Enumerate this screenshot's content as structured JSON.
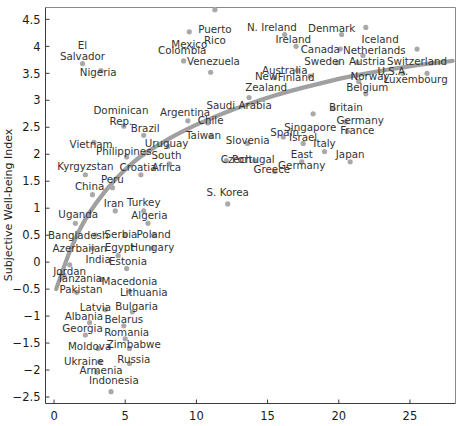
{
  "chart_data": {
    "type": "scatter",
    "title": "",
    "xlabel": "",
    "ylabel": "Subjective Well-being Index",
    "xlim": [
      -0.6,
      28.2
    ],
    "ylim": [
      -2.62,
      4.72
    ],
    "xticks": [
      0,
      5,
      10,
      15,
      20,
      25
    ],
    "xtick_labels": [
      "0",
      "5",
      "10",
      "15",
      "20",
      "25"
    ],
    "yticks": [
      4.5,
      4,
      3.5,
      3,
      2.5,
      2,
      1.5,
      1,
      0.5,
      0,
      -0.5,
      -1,
      -1.5,
      -2,
      -2.5
    ],
    "ytick_labels": [
      "4.5",
      "4",
      "3.5",
      "3",
      "2.5",
      "2",
      "1.5",
      "1",
      "0.5",
      "0",
      "−0.5",
      "−1",
      "−1.5",
      "−2",
      "−2.5"
    ],
    "grid": false,
    "legend": null,
    "marker_color": "#a9a9a9",
    "trend_color": "#a0a0a0",
    "points": [
      {
        "label": "Puerto Rico",
        "x": 11.3,
        "y": 4.68,
        "lx": 11.3,
        "ly": 4.32,
        "lines": [
          "Puerto",
          "Rico"
        ]
      },
      {
        "label": "Mexico",
        "x": 9.5,
        "y": 4.27,
        "lx": 9.5,
        "ly": 4.03,
        "lines": [
          "Mexico"
        ]
      },
      {
        "label": "N. Ireland",
        "x": 16.2,
        "y": 4.22,
        "lx": 15.3,
        "ly": 4.36,
        "lines": [
          "N. Ireland"
        ]
      },
      {
        "label": "Denmark",
        "x": 20.2,
        "y": 4.22,
        "lx": 19.5,
        "ly": 4.34,
        "lines": [
          "Denmark"
        ]
      },
      {
        "label": "Iceland",
        "x": 21.9,
        "y": 4.35,
        "lx": 22.9,
        "ly": 4.12,
        "lines": [
          "Iceland"
        ]
      },
      {
        "label": "Ireland",
        "x": 17.0,
        "y": 4.0,
        "lx": 16.8,
        "ly": 4.13,
        "lines": [
          "Ireland"
        ]
      },
      {
        "label": "El Salvador",
        "x": 2.0,
        "y": 3.68,
        "lx": 2.0,
        "ly": 4.02,
        "lines": [
          "El",
          "Salvador"
        ]
      },
      {
        "label": "Colombia",
        "x": 9.1,
        "y": 3.73,
        "lx": 9.0,
        "ly": 3.92,
        "lines": [
          "Colombia"
        ]
      },
      {
        "label": "Canada",
        "x": 20.1,
        "y": 3.95,
        "lx": 18.7,
        "ly": 3.95,
        "lines": [
          "Canada"
        ]
      },
      {
        "label": "Netherlands",
        "x": 21.7,
        "y": 3.83,
        "lx": 22.5,
        "ly": 3.93,
        "lines": [
          "Netherlands"
        ]
      },
      {
        "label": "Switzerland",
        "x": 25.5,
        "y": 3.95,
        "lx": 25.5,
        "ly": 3.72,
        "lines": [
          "Switzerland"
        ]
      },
      {
        "label": "Venezuela",
        "x": 11.0,
        "y": 3.52,
        "lx": 11.2,
        "ly": 3.72,
        "lines": [
          "Venezuela"
        ]
      },
      {
        "label": "Sweden",
        "x": 19.9,
        "y": 3.7,
        "lx": 19.0,
        "ly": 3.73,
        "lines": [
          "Sweden"
        ]
      },
      {
        "label": "Austria",
        "x": 21.3,
        "y": 3.7,
        "lx": 22.0,
        "ly": 3.72,
        "lines": [
          "Austria"
        ]
      },
      {
        "label": "Nigeria",
        "x": 3.3,
        "y": 3.55,
        "lx": 3.1,
        "ly": 3.52,
        "lines": [
          "Nigeria"
        ]
      },
      {
        "label": "Australia",
        "x": 17.1,
        "y": 3.55,
        "lx": 16.2,
        "ly": 3.56,
        "lines": [
          "Australia"
        ]
      },
      {
        "label": "Finland",
        "x": 18.0,
        "y": 3.45,
        "lx": 17.0,
        "ly": 3.42,
        "lines": [
          "Finland"
        ]
      },
      {
        "label": "New Zealand",
        "x": 15.5,
        "y": 3.42,
        "lx": 14.9,
        "ly": 3.45,
        "lines": [
          "New",
          "Zealand"
        ]
      },
      {
        "label": "U.S.A.",
        "x": 24.5,
        "y": 3.5,
        "lx": 23.8,
        "ly": 3.53,
        "lines": [
          "U.S.A."
        ]
      },
      {
        "label": "Luxembourg",
        "x": 26.2,
        "y": 3.5,
        "lx": 25.4,
        "ly": 3.39,
        "lines": [
          "Luxembourg"
        ]
      },
      {
        "label": "Norway",
        "x": 21.4,
        "y": 3.35,
        "lx": 22.2,
        "ly": 3.44,
        "lines": [
          "Norway"
        ]
      },
      {
        "label": "Belgium",
        "x": 21.9,
        "y": 3.12,
        "lx": 22.0,
        "ly": 3.24,
        "lines": [
          "Belgium"
        ]
      },
      {
        "label": "Saudi Arabia",
        "x": 13.7,
        "y": 3.05,
        "lx": 13.0,
        "ly": 2.9,
        "lines": [
          "Saudi Arabia"
        ]
      },
      {
        "label": "Britain",
        "x": 19.6,
        "y": 2.85,
        "lx": 20.5,
        "ly": 2.87,
        "lines": [
          "Britain"
        ]
      },
      {
        "label": "Dominican Rep.",
        "x": 4.9,
        "y": 2.52,
        "lx": 4.7,
        "ly": 2.82,
        "lines": [
          "Dominican",
          "Rep."
        ]
      },
      {
        "label": "Argentina",
        "x": 9.4,
        "y": 2.62,
        "lx": 9.2,
        "ly": 2.78,
        "lines": [
          "Argentina"
        ]
      },
      {
        "label": "Chile",
        "x": 10.8,
        "y": 2.58,
        "lx": 11.0,
        "ly": 2.62,
        "lines": [
          "Chile"
        ]
      },
      {
        "label": "Singapore",
        "x": 18.2,
        "y": 2.75,
        "lx": 18.0,
        "ly": 2.5,
        "lines": [
          "Singapore"
        ]
      },
      {
        "label": "Germany",
        "x": 20.5,
        "y": 2.6,
        "lx": 21.5,
        "ly": 2.62,
        "lines": [
          "Germany"
        ]
      },
      {
        "label": "France",
        "x": 20.6,
        "y": 2.42,
        "lx": 21.3,
        "ly": 2.45,
        "lines": [
          "France"
        ]
      },
      {
        "label": "Brazil",
        "x": 6.3,
        "y": 2.35,
        "lx": 6.4,
        "ly": 2.48,
        "lines": [
          "Brazil"
        ]
      },
      {
        "label": "Taiwan",
        "x": 11.0,
        "y": 2.33,
        "lx": 10.5,
        "ly": 2.35,
        "lines": [
          "Taiwan"
        ]
      },
      {
        "label": "Slovenia",
        "x": 13.6,
        "y": 2.2,
        "lx": 13.6,
        "ly": 2.26,
        "lines": [
          "Slovenia"
        ]
      },
      {
        "label": "Spain",
        "x": 16.1,
        "y": 2.32,
        "lx": 16.2,
        "ly": 2.4,
        "lines": [
          "Spain"
        ]
      },
      {
        "label": "Israel",
        "x": 17.5,
        "y": 2.2,
        "lx": 17.5,
        "ly": 2.32,
        "lines": [
          "Israel"
        ]
      },
      {
        "label": "Vietnam",
        "x": 2.8,
        "y": 2.22,
        "lx": 2.6,
        "ly": 2.18,
        "lines": [
          "Vietnam"
        ]
      },
      {
        "label": "Uruguay",
        "x": 8.0,
        "y": 2.15,
        "lx": 7.9,
        "ly": 2.2,
        "lines": [
          "Uruguay"
        ]
      },
      {
        "label": "Italy",
        "x": 19.0,
        "y": 2.05,
        "lx": 19.0,
        "ly": 2.2,
        "lines": [
          "Italy"
        ]
      },
      {
        "label": "Philippines",
        "x": 5.1,
        "y": 1.95,
        "lx": 4.9,
        "ly": 2.05,
        "lines": [
          "Philippines"
        ]
      },
      {
        "label": "South Africa",
        "x": 8.1,
        "y": 1.82,
        "lx": 7.9,
        "ly": 1.98,
        "lines": [
          "South",
          "Africa"
        ]
      },
      {
        "label": "Czech",
        "x": 12.1,
        "y": 1.88,
        "lx": 12.8,
        "ly": 1.9,
        "lines": [
          "Czech"
        ]
      },
      {
        "label": "Portugal",
        "x": 14.1,
        "y": 1.88,
        "lx": 14.0,
        "ly": 1.9,
        "lines": [
          "Portugal"
        ]
      },
      {
        "label": "East Germany",
        "x": 17.4,
        "y": 1.86,
        "lx": 17.4,
        "ly": 2.0,
        "lines": [
          "East",
          "Germany"
        ]
      },
      {
        "label": "Japan",
        "x": 20.8,
        "y": 1.86,
        "lx": 20.8,
        "ly": 2.0,
        "lines": [
          "Japan"
        ]
      },
      {
        "label": "Kyrgyzstan",
        "x": 2.2,
        "y": 1.62,
        "lx": 2.2,
        "ly": 1.78,
        "lines": [
          "Kyrgyzstan"
        ]
      },
      {
        "label": "Croatia",
        "x": 6.1,
        "y": 1.62,
        "lx": 5.9,
        "ly": 1.75,
        "lines": [
          "Croatia"
        ]
      },
      {
        "label": "Greece",
        "x": 15.5,
        "y": 1.68,
        "lx": 15.3,
        "ly": 1.72,
        "lines": [
          "Greece"
        ]
      },
      {
        "label": "Peru",
        "x": 4.1,
        "y": 1.38,
        "lx": 4.1,
        "ly": 1.53,
        "lines": [
          "Peru"
        ]
      },
      {
        "label": "China",
        "x": 2.7,
        "y": 1.25,
        "lx": 2.5,
        "ly": 1.4,
        "lines": [
          "China"
        ]
      },
      {
        "label": "S. Korea",
        "x": 12.2,
        "y": 1.08,
        "lx": 12.2,
        "ly": 1.3,
        "lines": [
          "S. Korea"
        ]
      },
      {
        "label": "Iran",
        "x": 4.3,
        "y": 0.95,
        "lx": 4.2,
        "ly": 1.08,
        "lines": [
          "Iran"
        ]
      },
      {
        "label": "Turkey",
        "x": 6.3,
        "y": 0.95,
        "lx": 6.3,
        "ly": 1.1,
        "lines": [
          "Turkey"
        ]
      },
      {
        "label": "Uganda",
        "x": 1.5,
        "y": 0.72,
        "lx": 1.7,
        "ly": 0.88,
        "lines": [
          "Uganda"
        ]
      },
      {
        "label": "Algeria",
        "x": 6.6,
        "y": 0.72,
        "lx": 6.7,
        "ly": 0.86,
        "lines": [
          "Algeria"
        ]
      },
      {
        "label": "Bangladesh",
        "x": 2.9,
        "y": 0.5,
        "lx": 1.7,
        "ly": 0.5,
        "lines": [
          "Bangladesh"
        ]
      },
      {
        "label": "Serbia",
        "x": 5.0,
        "y": 0.5,
        "lx": 4.7,
        "ly": 0.52,
        "lines": [
          "Serbia"
        ]
      },
      {
        "label": "Poland",
        "x": 7.0,
        "y": 0.5,
        "lx": 7.0,
        "ly": 0.52,
        "lines": [
          "Poland"
        ]
      },
      {
        "label": "Azerbaijan",
        "x": 2.7,
        "y": 0.26,
        "lx": 1.8,
        "ly": 0.26,
        "lines": [
          "Azerbaijan"
        ]
      },
      {
        "label": "Egypt",
        "x": 4.5,
        "y": 0.12,
        "lx": 4.6,
        "ly": 0.27,
        "lines": [
          "Egypt"
        ]
      },
      {
        "label": "Hungary",
        "x": 6.9,
        "y": 0.26,
        "lx": 6.9,
        "ly": 0.28,
        "lines": [
          "Hungary"
        ]
      },
      {
        "label": "India",
        "x": 1.1,
        "y": -0.05,
        "lx": 3.1,
        "ly": 0.06,
        "lines": [
          "India"
        ]
      },
      {
        "label": "Estonia",
        "x": 5.1,
        "y": -0.12,
        "lx": 5.2,
        "ly": 0.02,
        "lines": [
          "Estonia"
        ]
      },
      {
        "label": "Jordan",
        "x": 0.7,
        "y": -0.24,
        "lx": 1.1,
        "ly": -0.18,
        "lines": [
          "Jordan"
        ]
      },
      {
        "label": "Tanzania",
        "x": 0.6,
        "y": -0.28,
        "lx": 1.8,
        "ly": -0.3,
        "lines": [
          "Tanzania"
        ]
      },
      {
        "label": "Macedonia",
        "x": 3.3,
        "y": -0.32,
        "lx": 5.3,
        "ly": -0.36,
        "lines": [
          "Macedonia"
        ]
      },
      {
        "label": "Pakistan",
        "x": 1.6,
        "y": -0.56,
        "lx": 1.9,
        "ly": -0.5,
        "lines": [
          "Pakistan"
        ]
      },
      {
        "label": "Lithuania",
        "x": 5.3,
        "y": -0.54,
        "lx": 6.3,
        "ly": -0.56,
        "lines": [
          "Lithuania"
        ]
      },
      {
        "label": "Latvia",
        "x": 3.6,
        "y": -0.88,
        "lx": 2.9,
        "ly": -0.84,
        "lines": [
          "Latvia"
        ]
      },
      {
        "label": "Bulgaria",
        "x": 5.5,
        "y": -0.92,
        "lx": 5.8,
        "ly": -0.82,
        "lines": [
          "Bulgaria"
        ]
      },
      {
        "label": "Albania",
        "x": 2.5,
        "y": -1.12,
        "lx": 2.1,
        "ly": -1.0,
        "lines": [
          "Albania"
        ]
      },
      {
        "label": "Belarus",
        "x": 4.9,
        "y": -1.18,
        "lx": 4.9,
        "ly": -1.06,
        "lines": [
          "Belarus"
        ]
      },
      {
        "label": "Georgia",
        "x": 2.2,
        "y": -1.35,
        "lx": 2.0,
        "ly": -1.22,
        "lines": [
          "Georgia"
        ]
      },
      {
        "label": "Romania",
        "x": 5.0,
        "y": -1.42,
        "lx": 5.1,
        "ly": -1.3,
        "lines": [
          "Romania"
        ]
      },
      {
        "label": "Moldova",
        "x": 3.1,
        "y": -1.6,
        "lx": 2.5,
        "ly": -1.56,
        "lines": [
          "Moldova"
        ]
      },
      {
        "label": "Zimbabwe",
        "x": 5.3,
        "y": -1.6,
        "lx": 5.6,
        "ly": -1.52,
        "lines": [
          "Zimbabwe"
        ]
      },
      {
        "label": "Ukraine",
        "x": 3.2,
        "y": -1.85,
        "lx": 2.1,
        "ly": -1.84,
        "lines": [
          "Ukraine"
        ]
      },
      {
        "label": "Russia",
        "x": 5.3,
        "y": -1.88,
        "lx": 5.6,
        "ly": -1.8,
        "lines": [
          "Russia"
        ]
      },
      {
        "label": "Armenia",
        "x": 3.0,
        "y": -2.04,
        "lx": 3.3,
        "ly": -2.0,
        "lines": [
          "Armenia"
        ]
      },
      {
        "label": "Indonesia",
        "x": 4.0,
        "y": -2.4,
        "lx": 4.2,
        "ly": -2.2,
        "lines": [
          "Indonesia"
        ]
      }
    ],
    "trend_curve": [
      {
        "x": 0.15,
        "y": -0.5
      },
      {
        "x": 1.0,
        "y": 0.15
      },
      {
        "x": 2.0,
        "y": 0.72
      },
      {
        "x": 3.0,
        "y": 1.12
      },
      {
        "x": 4.0,
        "y": 1.45
      },
      {
        "x": 5.0,
        "y": 1.72
      },
      {
        "x": 6.0,
        "y": 1.95
      },
      {
        "x": 7.0,
        "y": 2.12
      },
      {
        "x": 8.0,
        "y": 2.28
      },
      {
        "x": 9.0,
        "y": 2.42
      },
      {
        "x": 10.0,
        "y": 2.55
      },
      {
        "x": 11.0,
        "y": 2.66
      },
      {
        "x": 12.0,
        "y": 2.77
      },
      {
        "x": 13.0,
        "y": 2.87
      },
      {
        "x": 14.0,
        "y": 2.96
      },
      {
        "x": 15.0,
        "y": 3.05
      },
      {
        "x": 16.0,
        "y": 3.13
      },
      {
        "x": 17.0,
        "y": 3.2
      },
      {
        "x": 18.0,
        "y": 3.27
      },
      {
        "x": 19.0,
        "y": 3.33
      },
      {
        "x": 20.0,
        "y": 3.4
      },
      {
        "x": 21.0,
        "y": 3.45
      },
      {
        "x": 22.0,
        "y": 3.5
      },
      {
        "x": 23.0,
        "y": 3.55
      },
      {
        "x": 24.0,
        "y": 3.59
      },
      {
        "x": 25.0,
        "y": 3.63
      },
      {
        "x": 26.0,
        "y": 3.67
      },
      {
        "x": 27.0,
        "y": 3.7
      },
      {
        "x": 28.0,
        "y": 3.73
      }
    ]
  }
}
